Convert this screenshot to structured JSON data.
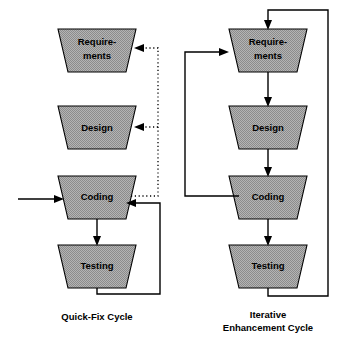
{
  "figure": {
    "background_color": "#ffffff",
    "shape_fill_color": "#a8a8a8",
    "line_color": "#000000"
  },
  "diagrams": [
    {
      "id": "quick-fix-cycle",
      "caption_lines": [
        "Quick-Fix Cycle"
      ],
      "stages": [
        {
          "id": "requirements",
          "label_lines": [
            "Require-",
            "ments"
          ]
        },
        {
          "id": "design",
          "label_lines": [
            "Design"
          ]
        },
        {
          "id": "coding",
          "label_lines": [
            "Coding"
          ]
        },
        {
          "id": "testing",
          "label_lines": [
            "Testing"
          ]
        }
      ],
      "connections": [
        {
          "id": "external-input-to-coding",
          "style": "solid",
          "from": "external",
          "to": "coding"
        },
        {
          "id": "coding-to-testing",
          "style": "solid",
          "from": "coding",
          "to": "testing"
        },
        {
          "id": "testing-feedback-to-coding",
          "style": "solid",
          "from": "testing",
          "to": "coding"
        },
        {
          "id": "coding-feedback-to-design",
          "style": "dotted",
          "from": "coding",
          "to": "design"
        },
        {
          "id": "coding-feedback-to-requirements",
          "style": "dotted",
          "from": "coding",
          "to": "requirements"
        }
      ]
    },
    {
      "id": "iterative-enhancement-cycle",
      "caption_lines": [
        "Iterative",
        "Enhancement Cycle"
      ],
      "stages": [
        {
          "id": "requirements",
          "label_lines": [
            "Require-",
            "ments"
          ]
        },
        {
          "id": "design",
          "label_lines": [
            "Design"
          ]
        },
        {
          "id": "coding",
          "label_lines": [
            "Coding"
          ]
        },
        {
          "id": "testing",
          "label_lines": [
            "Testing"
          ]
        }
      ],
      "connections": [
        {
          "id": "requirements-to-design",
          "style": "solid",
          "from": "requirements",
          "to": "design"
        },
        {
          "id": "design-to-coding",
          "style": "solid",
          "from": "design",
          "to": "coding"
        },
        {
          "id": "coding-to-testing",
          "style": "solid",
          "from": "coding",
          "to": "testing"
        },
        {
          "id": "coding-feedback-to-requirements",
          "style": "solid",
          "from": "coding",
          "to": "requirements"
        },
        {
          "id": "testing-feedback-to-requirements",
          "style": "solid",
          "from": "testing",
          "to": "requirements"
        }
      ]
    }
  ]
}
